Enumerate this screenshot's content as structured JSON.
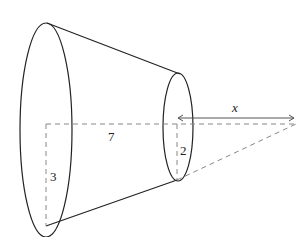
{
  "diagram": {
    "type": "frustum-of-cone",
    "labels": {
      "length": "7",
      "large_radius": "3",
      "small_radius": "2",
      "extension": "x"
    },
    "colors": {
      "stroke": "#222222",
      "dashed": "#888888",
      "arrow": "#555555",
      "background": "#ffffff"
    }
  }
}
